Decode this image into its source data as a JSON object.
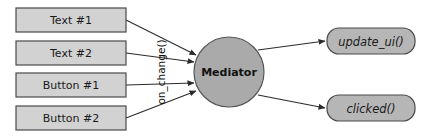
{
  "diagram": {
    "background_color": "#ffffff",
    "colors": {
      "box_fill": "#d2d2d2",
      "rounded_fill": "#b6b6b6",
      "circle_fill": "#aaaaaa",
      "stroke": "#4a4a4a",
      "edge": "#2b2b2b",
      "text": "#1a1a1a"
    },
    "sources": [
      {
        "id": "text1",
        "label": "Text #1",
        "x": 16,
        "y": 8,
        "w": 110,
        "h": 24
      },
      {
        "id": "text2",
        "label": "Text #2",
        "x": 16,
        "y": 41,
        "w": 110,
        "h": 24
      },
      {
        "id": "button1",
        "label": "Button #1",
        "x": 16,
        "y": 73,
        "w": 110,
        "h": 24
      },
      {
        "id": "button2",
        "label": "Button #2",
        "x": 16,
        "y": 106,
        "w": 110,
        "h": 24
      }
    ],
    "mediator": {
      "id": "mediator",
      "label": "Mediator",
      "cx": 229,
      "cy": 72,
      "r": 35
    },
    "targets": [
      {
        "id": "update_ui",
        "label": "update_ui()",
        "x": 327,
        "y": 28,
        "w": 88,
        "h": 26,
        "rx": 12
      },
      {
        "id": "clicked",
        "label": "clicked()",
        "x": 327,
        "y": 95,
        "w": 88,
        "h": 26,
        "rx": 12
      }
    ],
    "edge_label": {
      "id": "on_change",
      "label": "on_change()",
      "x": 162,
      "y": 72,
      "rotation": -90
    },
    "edges_in": [
      {
        "from": "text1",
        "to": "mediator",
        "x1": 126,
        "y1": 20,
        "x2": 196,
        "y2": 55
      },
      {
        "from": "text2",
        "to": "mediator",
        "x1": 126,
        "y1": 53,
        "x2": 194,
        "y2": 62
      },
      {
        "from": "button1",
        "to": "mediator",
        "x1": 126,
        "y1": 85,
        "x2": 194,
        "y2": 83
      },
      {
        "from": "button2",
        "to": "mediator",
        "x1": 126,
        "y1": 118,
        "x2": 196,
        "y2": 91
      }
    ],
    "edges_out": [
      {
        "from": "mediator",
        "to": "update_ui",
        "x1": 258,
        "y1": 50,
        "x2": 325,
        "y2": 41
      },
      {
        "from": "mediator",
        "to": "clicked",
        "x1": 258,
        "y1": 95,
        "x2": 325,
        "y2": 108
      }
    ]
  }
}
